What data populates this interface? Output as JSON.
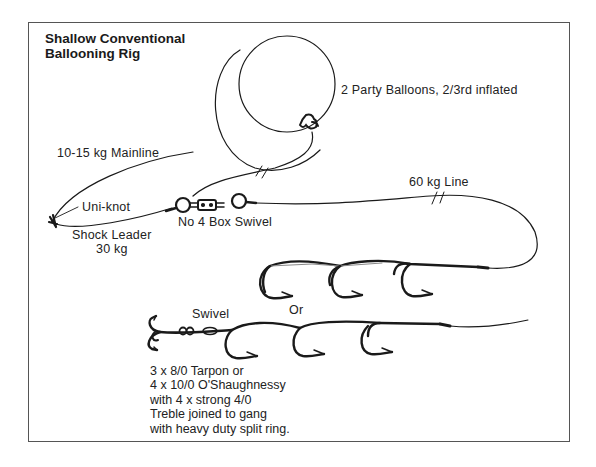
{
  "diagram": {
    "title_lines": [
      "Shallow Conventional",
      "Ballooning Rig"
    ],
    "labels": {
      "balloons": "2 Party Balloons, 2/3rd inflated",
      "mainline": "10-15 kg Mainline",
      "uniknot": "Uni-knot",
      "shock_leader_1": "Shock Leader",
      "shock_leader_2": "30 kg",
      "box_swivel": "No 4 Box Swivel",
      "line_60kg": "60 kg Line",
      "or": "Or",
      "swivel": "Swivel"
    },
    "notes_lines": [
      "3 x 8/0 Tarpon or",
      "4 x 10/0 O'Shaughnessy",
      "with 4 x strong 4/0",
      "Treble joined to gang",
      "with heavy duty split ring."
    ],
    "components": [
      {
        "name": "party-balloons",
        "count": 2,
        "inflation": "2/3rd"
      },
      {
        "name": "mainline",
        "strength": "10-15 kg"
      },
      {
        "name": "uni-knot"
      },
      {
        "name": "shock-leader",
        "strength": "30 kg"
      },
      {
        "name": "box-swivel",
        "size": "No 4"
      },
      {
        "name": "line",
        "strength": "60 kg"
      },
      {
        "name": "hook-gang-top",
        "hooks": 3
      },
      {
        "name": "hook-gang-bottom",
        "hooks": 3,
        "treble": true,
        "swivel": true
      }
    ],
    "colors": {
      "ink": "#1a1a1a",
      "frame": "#555555",
      "background": "#ffffff"
    }
  }
}
